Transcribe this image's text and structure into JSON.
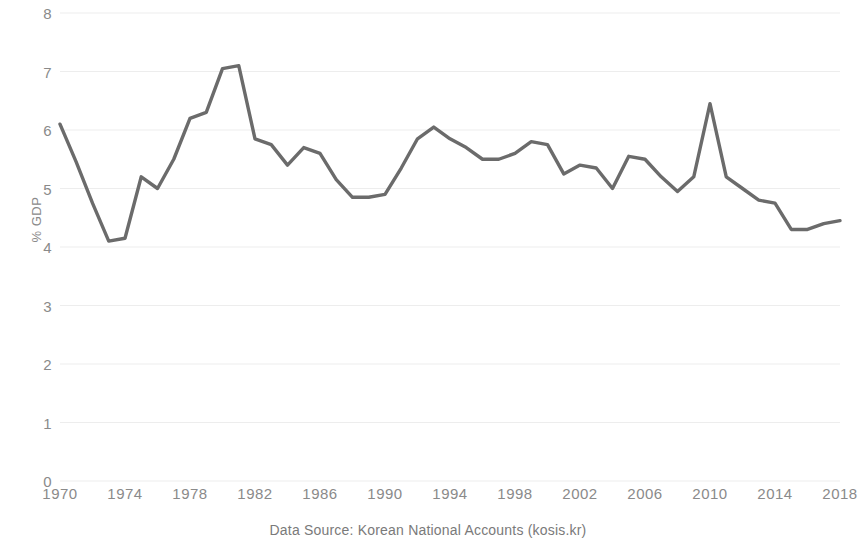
{
  "chart_data": {
    "type": "line",
    "title": "",
    "subtitle": "",
    "xlabel": "",
    "ylabel": "% GDP",
    "caption": "Data Source: Korean National Accounts (kosis.kr)",
    "grid": true,
    "legend": false,
    "legend_position": "none",
    "line_color": "#6b6b6b",
    "grid_color": "#ededed",
    "tick_label_color": "#8a8a8a",
    "background_color": "#ffffff",
    "xlim": [
      1970,
      2018
    ],
    "ylim": [
      0,
      8
    ],
    "y_ticks": [
      0,
      1,
      2,
      3,
      4,
      5,
      6,
      7,
      8
    ],
    "y_tick_labels": [
      "0",
      "1",
      "2",
      "3",
      "4",
      "5",
      "6",
      "7",
      "8"
    ],
    "x_ticks": [
      1970,
      1974,
      1978,
      1982,
      1986,
      1990,
      1994,
      1998,
      2002,
      2006,
      2010,
      2014,
      2018
    ],
    "x_tick_labels": [
      "1970",
      "1974",
      "1978",
      "1982",
      "1986",
      "1990",
      "1994",
      "1998",
      "2002",
      "2006",
      "2010",
      "2014",
      "2018"
    ],
    "x": [
      1970,
      1971,
      1972,
      1973,
      1974,
      1975,
      1976,
      1977,
      1978,
      1979,
      1980,
      1981,
      1982,
      1983,
      1984,
      1985,
      1986,
      1987,
      1988,
      1989,
      1990,
      1991,
      1992,
      1993,
      1994,
      1995,
      1996,
      1997,
      1998,
      1999,
      2000,
      2001,
      2002,
      2003,
      2004,
      2005,
      2006,
      2007,
      2008,
      2009,
      2010,
      2011,
      2012,
      2013,
      2014,
      2015,
      2016,
      2017,
      2018
    ],
    "values": [
      6.1,
      5.45,
      4.75,
      4.1,
      4.15,
      5.2,
      5.0,
      5.5,
      6.2,
      6.3,
      7.05,
      7.1,
      5.85,
      5.75,
      5.4,
      5.7,
      5.6,
      5.15,
      4.85,
      4.85,
      4.9,
      5.35,
      5.85,
      6.05,
      5.85,
      5.7,
      5.5,
      5.5,
      5.6,
      5.8,
      5.75,
      5.25,
      5.4,
      5.35,
      5.0,
      5.55,
      5.5,
      5.2,
      4.95,
      5.2,
      6.45,
      5.2,
      5.0,
      4.8,
      4.75,
      4.3,
      4.3,
      4.4,
      4.45
    ],
    "series": [
      {
        "name": "Government consumption share of GDP",
        "values": [
          6.1,
          5.45,
          4.75,
          4.1,
          4.15,
          5.2,
          5.0,
          5.5,
          6.2,
          6.3,
          7.05,
          7.1,
          5.85,
          5.75,
          5.4,
          5.7,
          5.6,
          5.15,
          4.85,
          4.85,
          4.9,
          5.35,
          5.85,
          6.05,
          5.85,
          5.7,
          5.5,
          5.5,
          5.6,
          5.8,
          5.75,
          5.25,
          5.4,
          5.35,
          5.0,
          5.55,
          5.5,
          5.2,
          4.95,
          5.2,
          6.45,
          5.2,
          5.0,
          4.8,
          4.75,
          4.3,
          4.3,
          4.4,
          4.45
        ]
      }
    ],
    "annotations": []
  }
}
